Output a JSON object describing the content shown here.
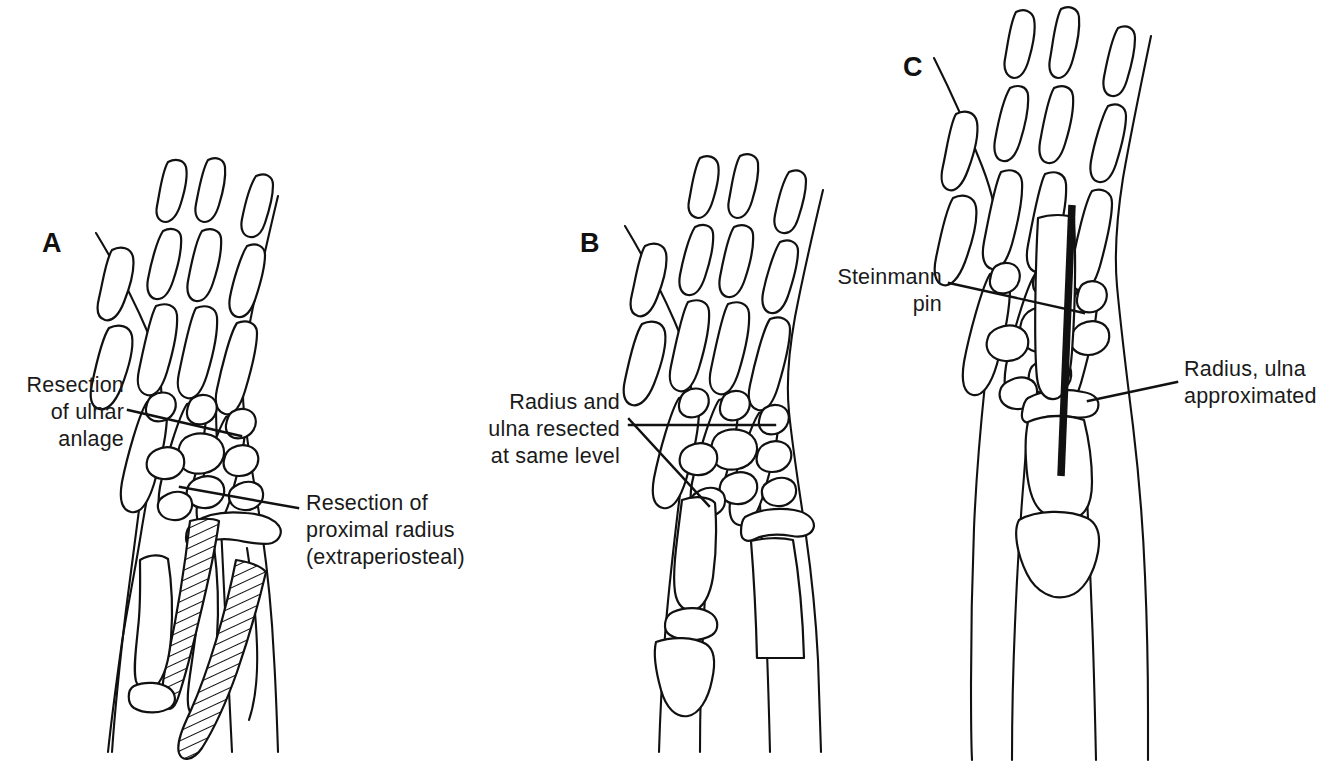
{
  "figure": {
    "type": "medical-line-illustration",
    "background_color": "#ffffff",
    "line_color": "#111111"
  },
  "panels": [
    {
      "id": "A",
      "letter": "A",
      "labels": [
        {
          "name": "resection-of-ulnar-anlage",
          "lines": [
            "Resection",
            "of ulnar",
            "anlage"
          ],
          "align": "right"
        },
        {
          "name": "resection-of-proximal-radius",
          "lines": [
            "Resection of",
            "proximal radius",
            "(extraperiosteal)"
          ],
          "align": "left"
        }
      ]
    },
    {
      "id": "B",
      "letter": "B",
      "labels": [
        {
          "name": "radius-and-ulna-resected",
          "lines": [
            "Radius and",
            "ulna resected",
            "at same level"
          ],
          "align": "right"
        }
      ]
    },
    {
      "id": "C",
      "letter": "C",
      "labels": [
        {
          "name": "steinmann-pin",
          "lines": [
            "Steinmann",
            "pin"
          ],
          "align": "right"
        },
        {
          "name": "radius-ulna-approximated",
          "lines": [
            "Radius, ulna",
            "approximated"
          ],
          "align": "left"
        }
      ]
    }
  ],
  "text": {
    "panel_a_letter": "A",
    "panel_b_letter": "B",
    "panel_c_letter": "C",
    "a1_line1": "Resection",
    "a1_line2": "of ulnar",
    "a1_line3": "anlage",
    "a2_line1": "Resection of",
    "a2_line2": "proximal radius",
    "a2_line3": "(extraperiosteal)",
    "b1_line1": "Radius and",
    "b1_line2": "ulna resected",
    "b1_line3": "at same level",
    "c1_line1": "Steinmann",
    "c1_line2": "pin",
    "c2_line1": "Radius, ulna",
    "c2_line2": "approximated"
  }
}
